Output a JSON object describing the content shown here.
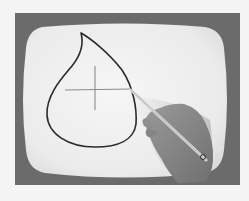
{
  "image": {
    "description": "Photograph of a CRT monitor displaying a hand-drawn teardrop shape with a crosshair, being drawn by a hand holding a light pen",
    "colors": {
      "page_background": "#f4f4f4",
      "monitor_bezel": "#6b6b6b",
      "screen": "#ececec",
      "stroke": "#2a2a2a",
      "crosshair": "#8a8a8a",
      "hand": "#8c8c8c",
      "pen": "#d8d8d8"
    },
    "elements": {
      "monitor": "crt-monitor-frame",
      "screen": "crt-screen",
      "drawing": "teardrop-outline",
      "crosshair": "crosshair-cursor",
      "pen": "light-pen",
      "hand": "hand"
    }
  }
}
